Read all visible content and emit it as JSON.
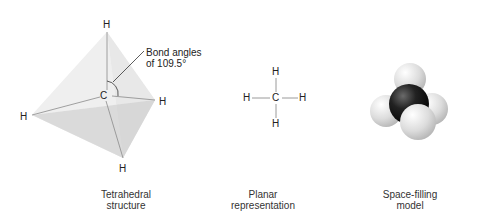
{
  "panels": {
    "tetrahedral": {
      "caption_line1": "Tetrahedral",
      "caption_line2": "structure",
      "atoms": {
        "top": "H",
        "center": "C",
        "right": "H",
        "left": "H",
        "bottom": "H"
      },
      "annotation_line1": "Bond angles",
      "annotation_line2": "of 109.5°"
    },
    "planar": {
      "caption_line1": "Planar",
      "caption_line2": "representation",
      "atoms": {
        "top": "H",
        "left": "H",
        "center": "C",
        "right": "H",
        "bottom": "H"
      }
    },
    "space_filling": {
      "caption_line1": "Space-filling",
      "caption_line2": "model"
    }
  },
  "colors": {
    "carbon": "#1a1a1a",
    "hydrogen": "#d9d9d9",
    "tetra_face": "#e6e6e6",
    "bond_line": "#888888"
  }
}
